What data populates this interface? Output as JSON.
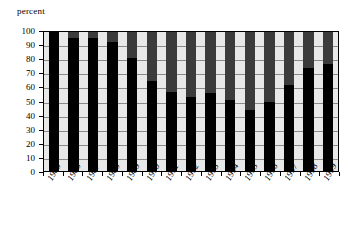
{
  "chart_data": {
    "type": "bar",
    "title": "",
    "subtitle": "",
    "xlabel": "",
    "ylabel": "percent",
    "ylim": [
      0,
      100
    ],
    "xlim_categories": 15,
    "grid": true,
    "legend": "none",
    "stacked": true,
    "stacked_total": 100,
    "orientation": "vertical",
    "categories": [
      "1985",
      "1986",
      "1987",
      "1988",
      "1989",
      "1990",
      "1991",
      "1992",
      "1993",
      "1994",
      "1995",
      "1996",
      "1997",
      "1998",
      "1999"
    ],
    "ytick_labels": [
      "100",
      "90",
      "80",
      "70",
      "60",
      "50",
      "40",
      "30",
      "20",
      "10",
      "0"
    ],
    "ytick_values": [
      100,
      90,
      80,
      70,
      60,
      50,
      40,
      30,
      20,
      10,
      0
    ],
    "series": [
      {
        "name": "lower-segment",
        "color": "#000000",
        "values": [
          100,
          96,
          96,
          93,
          81,
          65,
          57,
          53,
          56,
          51,
          44,
          50,
          62,
          74,
          77
        ]
      },
      {
        "name": "upper-segment",
        "color": "#3b3b3b",
        "values": [
          0,
          4,
          4,
          7,
          19,
          35,
          43,
          47,
          44,
          49,
          56,
          50,
          38,
          26,
          23
        ]
      }
    ],
    "plot_background": "#e8e8e8",
    "gridline_color": "#8a8a8a",
    "frame_color": "#000000"
  }
}
